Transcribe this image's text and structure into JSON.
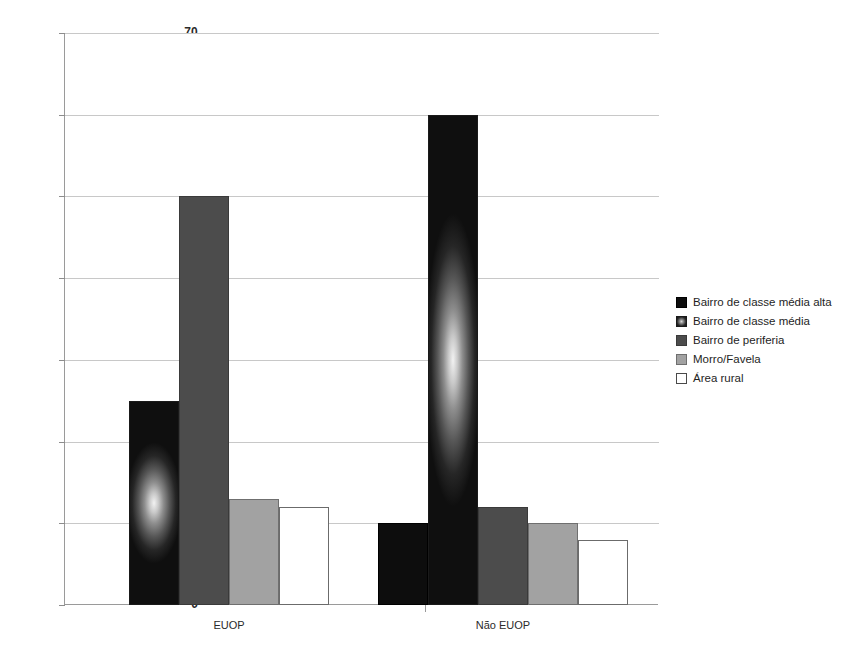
{
  "chart_data": {
    "type": "bar",
    "title": "",
    "subtitle": "",
    "xlabel": "",
    "ylabel": "",
    "categories": [
      "EUOP",
      "Não EUOP"
    ],
    "ylim": [
      0,
      70
    ],
    "ytick_labels": [
      "0",
      "10",
      "20",
      "30",
      "40",
      "50",
      "60",
      "70"
    ],
    "ytick_values": [
      0,
      10,
      20,
      30,
      40,
      50,
      60,
      70
    ],
    "grid": true,
    "legend_position": "right",
    "series": [
      {
        "name": "Bairro de classe média alta",
        "swatch": "solid-black",
        "color": "#0d0d0d",
        "values": [
          null,
          10
        ]
      },
      {
        "name": "Bairro de classe média",
        "swatch": "radial-gradient-black",
        "color": "#1a1a1a",
        "values": [
          25,
          60
        ]
      },
      {
        "name": "Bairro de periferia",
        "swatch": "dark-gray",
        "color": "#4c4c4c",
        "values": [
          50,
          12
        ]
      },
      {
        "name": "Morro/Favela",
        "swatch": "medium-gray",
        "color": "#a2a2a2",
        "values": [
          13,
          10
        ]
      },
      {
        "name": "Área rural",
        "swatch": "white-outlined",
        "color": "#ffffff",
        "values": [
          12,
          8
        ]
      }
    ]
  }
}
